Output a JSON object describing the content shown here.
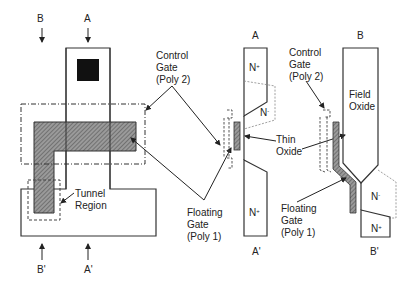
{
  "diagram": {
    "top_view": {
      "section_markers": {
        "B": "B",
        "A": "A",
        "B_prime": "B'",
        "A_prime": "A'"
      },
      "labels": {
        "control_gate": [
          "Control",
          "Gate",
          "(Poly 2)"
        ],
        "tunnel_region": [
          "Tunnel",
          "Region"
        ],
        "floating_gate": [
          "Floating",
          "Gate",
          "(Poly 1)"
        ]
      }
    },
    "section_A": {
      "top_label": "A",
      "bottom_label": "A'",
      "n_plus_top": "N",
      "n_plus_top_sup": "+",
      "n_minus": "N",
      "n_minus_sup": "-",
      "n_plus_bottom": "N",
      "n_plus_bottom_sup": "+",
      "thin_oxide": [
        "Thin",
        "Oxide"
      ]
    },
    "section_B": {
      "top_label": "B",
      "bottom_label": "B'",
      "field_oxide": [
        "Field",
        "Oxide"
      ],
      "control_gate": [
        "Control",
        "Gate",
        "(Poly 2)"
      ],
      "floating_gate": [
        "Floating",
        "Gate",
        "(Poly 1)"
      ],
      "n_minus": "N",
      "n_minus_sup": "-",
      "n_plus": "N",
      "n_plus_sup": "+"
    },
    "colors": {
      "line": "#333333",
      "hatch": "#777777",
      "contact": "#111111",
      "dashed": "#888888"
    }
  }
}
